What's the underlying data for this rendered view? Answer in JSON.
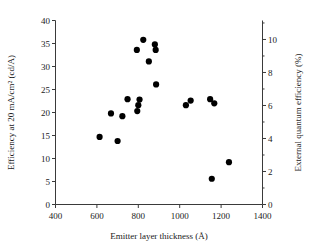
{
  "chart_data": {
    "type": "scatter",
    "title": "",
    "xlabel": "Emitter layer thickness (Å)",
    "ylabel": "Efficiency at 20 mA/cm² (cd/A)",
    "y2label": "External quantum efficiency (%)",
    "xlim": [
      400,
      1400
    ],
    "ylim": [
      0,
      40
    ],
    "y2lim": [
      0,
      11.15
    ],
    "xticks": [
      400,
      600,
      800,
      1000,
      1200,
      1400
    ],
    "xticklabels": [
      "400",
      "600",
      "800",
      "1000",
      "1200",
      "1400"
    ],
    "yticks": [
      0,
      5,
      10,
      15,
      20,
      25,
      30,
      35,
      40
    ],
    "yticklabels": [
      "0",
      "5",
      "10",
      "15",
      "20",
      "25",
      "30",
      "35",
      "40"
    ],
    "y2ticks": [
      0,
      2,
      4,
      6,
      8,
      10
    ],
    "y2ticklabels": [
      "0",
      "2",
      "4",
      "6",
      "8",
      "10"
    ],
    "y2minorticks": [
      1,
      3,
      5,
      7,
      9,
      11
    ],
    "grid": false,
    "legend": false,
    "marker": "filled-circle",
    "marker_color": "#000000",
    "marker_size": 6.2,
    "points": [
      {
        "x": 613,
        "y": 14.7
      },
      {
        "x": 668,
        "y": 19.8
      },
      {
        "x": 700,
        "y": 13.8
      },
      {
        "x": 723,
        "y": 19.2
      },
      {
        "x": 748,
        "y": 22.9
      },
      {
        "x": 793,
        "y": 33.6
      },
      {
        "x": 795,
        "y": 20.3
      },
      {
        "x": 800,
        "y": 21.6
      },
      {
        "x": 806,
        "y": 22.8
      },
      {
        "x": 824,
        "y": 35.8
      },
      {
        "x": 851,
        "y": 31.1
      },
      {
        "x": 880,
        "y": 34.8
      },
      {
        "x": 884,
        "y": 33.6
      },
      {
        "x": 886,
        "y": 26.1
      },
      {
        "x": 1030,
        "y": 21.6
      },
      {
        "x": 1053,
        "y": 22.6
      },
      {
        "x": 1147,
        "y": 22.9
      },
      {
        "x": 1155,
        "y": 5.6
      },
      {
        "x": 1167,
        "y": 22.0
      },
      {
        "x": 1238,
        "y": 9.2
      }
    ]
  }
}
